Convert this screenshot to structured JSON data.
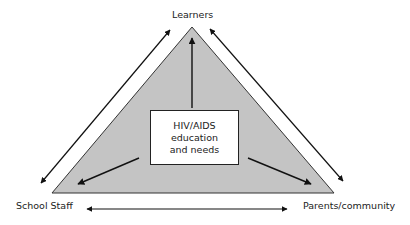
{
  "diagram": {
    "nodes": {
      "top": "Learners",
      "bottom_left": "School Staff",
      "bottom_right": "Parents/community"
    },
    "center": {
      "line1": "HIV/AIDS",
      "line2": "education",
      "line3": "and needs"
    },
    "colors": {
      "triangle_fill": "#c4c4c4",
      "stroke": "#111111"
    },
    "edges": [
      {
        "from": "Learners",
        "to": "School Staff",
        "type": "bidirectional"
      },
      {
        "from": "Learners",
        "to": "Parents/community",
        "type": "bidirectional"
      },
      {
        "from": "School Staff",
        "to": "Parents/community",
        "type": "bidirectional"
      },
      {
        "from": "HIV/AIDS education and needs",
        "to": "Learners",
        "type": "directed"
      },
      {
        "from": "HIV/AIDS education and needs",
        "to": "School Staff",
        "type": "directed"
      },
      {
        "from": "HIV/AIDS education and needs",
        "to": "Parents/community",
        "type": "directed"
      }
    ]
  }
}
